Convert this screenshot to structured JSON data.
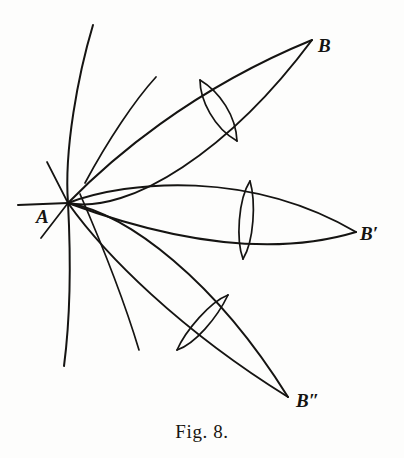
{
  "figure": {
    "caption": "Fig. 8.",
    "background_color": "#fdfdfc",
    "ink_color": "#151412",
    "width": 404,
    "height": 458,
    "labels": {
      "vertex_a": "A",
      "endpoint_b": "B",
      "endpoint_b_prime": "B′",
      "endpoint_b_double_prime": "B″"
    },
    "label_positions": {
      "vertex_a": {
        "x": 36,
        "y": 223
      },
      "endpoint_b": {
        "x": 318,
        "y": 52
      },
      "endpoint_b_prime": {
        "x": 360,
        "y": 240
      },
      "endpoint_b_double_prime": {
        "x": 296,
        "y": 407
      }
    },
    "points": {
      "a": {
        "x": 68,
        "y": 203
      },
      "b": {
        "x": 312,
        "y": 40
      },
      "b_prime": {
        "x": 356,
        "y": 232
      },
      "b_double_prime": {
        "x": 288,
        "y": 397
      }
    },
    "elements": [
      {
        "name": "horizontal-axis-line",
        "kind": "line"
      },
      {
        "name": "short-oblique-line",
        "kind": "line"
      },
      {
        "name": "long-background-arc",
        "kind": "arc"
      },
      {
        "name": "upper-lens-outer",
        "kind": "lens"
      },
      {
        "name": "upper-lens-inner",
        "kind": "lens"
      },
      {
        "name": "middle-lens-outer",
        "kind": "lens"
      },
      {
        "name": "middle-lens-inner",
        "kind": "lens"
      },
      {
        "name": "lower-lens-outer",
        "kind": "lens"
      },
      {
        "name": "lower-lens-inner",
        "kind": "lens"
      },
      {
        "name": "upper-crossing-arc",
        "kind": "arc"
      },
      {
        "name": "lower-crossing-arc",
        "kind": "arc"
      }
    ]
  }
}
